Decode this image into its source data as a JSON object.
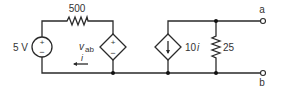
{
  "diagram": {
    "type": "circuit-schematic",
    "colors": {
      "wire": "#2a2a2a",
      "text": "#333333",
      "background": "#ffffff"
    },
    "components": {
      "voltage_source": {
        "label": "5 V",
        "plus": "+",
        "minus": "−"
      },
      "resistor_series": {
        "label": "500"
      },
      "dependent_voltage_source": {
        "label_main": "v",
        "label_sub": "ab",
        "plus": "+",
        "minus": "−"
      },
      "current_arrow": {
        "label": "i"
      },
      "dependent_current_source": {
        "label_main": "10",
        "label_var": "i",
        "arrow": "↓"
      },
      "resistor_shunt": {
        "label": "25"
      }
    },
    "terminals": {
      "a": "a",
      "b": "b"
    }
  }
}
